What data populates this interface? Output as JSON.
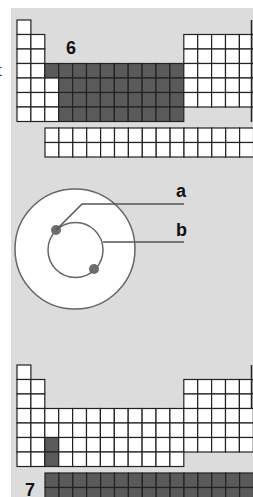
{
  "colors": {
    "background": "#dcdcdc",
    "empty_cell": "#ffffff",
    "highlight_cell": "#5a5a5a",
    "grid_line": "#222222",
    "electron": "#6e6e6e",
    "orbit": "#666666"
  },
  "left_edge_glyph": "t",
  "table_top": {
    "label": "6",
    "description": "Periodic table outline with d-block (transition metals, periods 4-7) highlighted",
    "highlighted_region": "d-block"
  },
  "atom": {
    "label_a": "a",
    "label_b": "b",
    "description": "Atom model: outer circle, inner orbit with two electrons",
    "electron_count": 2
  },
  "table_bottom": {
    "label": "7",
    "description": "Periodic table outline with single cell (group 3, period 6) highlighted and f-block row highlighted",
    "highlighted_region": "f-block"
  }
}
